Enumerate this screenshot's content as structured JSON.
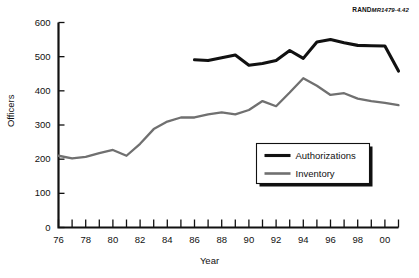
{
  "source_note": {
    "brand": "RAND",
    "document": "MR1479-4.42"
  },
  "chart_data": {
    "type": "line",
    "title": "",
    "subtitle": "",
    "xlabel": "Year",
    "ylabel": "Officers",
    "xlim": [
      1976,
      2001
    ],
    "ylim": [
      0,
      600
    ],
    "grid": false,
    "legend_position": "inside-lower-right",
    "y_ticks": [
      0,
      100,
      200,
      300,
      400,
      500,
      600
    ],
    "y_tick_labels": [
      "0",
      "100",
      "200",
      "300",
      "400",
      "500",
      "600"
    ],
    "x_ticks": [
      1976,
      1977,
      1978,
      1979,
      1980,
      1981,
      1982,
      1983,
      1984,
      1985,
      1986,
      1987,
      1988,
      1989,
      1990,
      1991,
      1992,
      1993,
      1994,
      1995,
      1996,
      1997,
      1998,
      1999,
      2000,
      2001
    ],
    "x_tick_labels": [
      "76",
      "",
      "78",
      "",
      "80",
      "",
      "82",
      "",
      "84",
      "",
      "86",
      "",
      "88",
      "",
      "90",
      "",
      "92",
      "",
      "94",
      "",
      "96",
      "",
      "98",
      "",
      "00",
      ""
    ],
    "series": [
      {
        "name": "Authorizations",
        "color": "#111111",
        "x": [
          1986,
          1987,
          1988,
          1989,
          1990,
          1991,
          1992,
          1993,
          1994,
          1995,
          1996,
          1997,
          1998,
          1999,
          2000,
          2001
        ],
        "values": [
          491,
          489,
          497,
          505,
          475,
          480,
          489,
          518,
          495,
          543,
          550,
          541,
          533,
          532,
          531,
          458
        ]
      },
      {
        "name": "Inventory",
        "color": "#707070",
        "x": [
          1976,
          1977,
          1978,
          1979,
          1980,
          1981,
          1982,
          1983,
          1984,
          1985,
          1986,
          1987,
          1988,
          1989,
          1990,
          1991,
          1992,
          1993,
          1994,
          1995,
          1996,
          1997,
          1998,
          1999,
          2000,
          2001
        ],
        "values": [
          210,
          202,
          207,
          218,
          227,
          210,
          245,
          288,
          310,
          322,
          322,
          331,
          337,
          331,
          344,
          370,
          355,
          395,
          437,
          415,
          388,
          393,
          377,
          370,
          365,
          358
        ]
      }
    ]
  },
  "legend": {
    "items": [
      {
        "label": "Authorizations",
        "color": "#111111"
      },
      {
        "label": "Inventory",
        "color": "#707070"
      }
    ]
  }
}
